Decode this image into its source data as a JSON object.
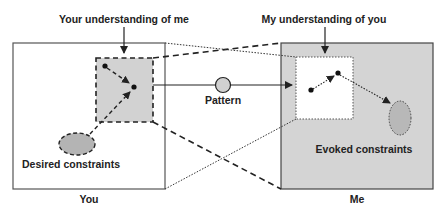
{
  "labels": {
    "your_understanding": "Your understanding of me",
    "my_understanding": "My understanding of you",
    "pattern": "Pattern",
    "desired_constraints": "Desired constraints",
    "evoked_constraints": "Evoked constraints",
    "you": "You",
    "me": "Me"
  },
  "colors": {
    "background": "#ffffff",
    "me_box_fill": "#d4d4d4",
    "understanding_fill": "#d2d2d2",
    "ellipse_fill": "#b4b4b4",
    "stroke": "#222222",
    "box_stroke": "#555555"
  },
  "nodes": [
    {
      "id": "you-box",
      "label": "You"
    },
    {
      "id": "me-box",
      "label": "Me"
    },
    {
      "id": "your-understanding-of-me",
      "style": "dashed, gray fill"
    },
    {
      "id": "my-understanding-of-you",
      "style": "dotted, white fill"
    },
    {
      "id": "pattern",
      "shape": "circle"
    },
    {
      "id": "desired-constraints",
      "shape": "ellipse",
      "style": "dashed"
    },
    {
      "id": "evoked-constraints",
      "shape": "ellipse",
      "style": "dotted"
    }
  ],
  "edges": [
    {
      "from": "your-understanding-of-me",
      "to": "my-understanding-of-you",
      "via": "pattern",
      "style": "solid arrow"
    },
    {
      "from": "desired-constraints",
      "to": "your-understanding-of-me",
      "style": "dashed arrow"
    },
    {
      "from": "my-understanding-of-you",
      "to": "evoked-constraints",
      "style": "dotted arrow"
    },
    {
      "from": "your-understanding-of-me",
      "to": "me-box",
      "style": "dashed projection lines"
    },
    {
      "from": "you-box",
      "to": "my-understanding-of-you",
      "style": "dotted projection lines"
    }
  ]
}
